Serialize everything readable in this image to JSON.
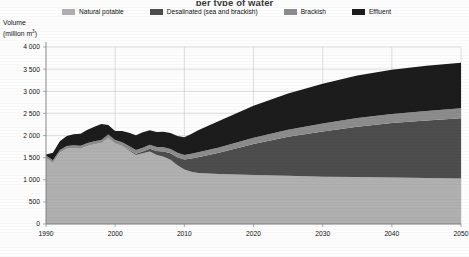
{
  "title": "per type of water",
  "axis_title_line1": "Volume",
  "axis_title_line2_pre": "(million m",
  "axis_title_line2_sup": "3",
  "axis_title_line2_post": ")",
  "legend": {
    "items": [
      {
        "label": "Natural potable",
        "color": "#b0b0b0",
        "name": "natural-potable"
      },
      {
        "label": "Desalinated (sea and brackish)",
        "color": "#4d4d4d",
        "name": "desalinated"
      },
      {
        "label": "Brackish",
        "color": "#8c8c8c",
        "name": "brackish"
      },
      {
        "label": "Effluent",
        "color": "#1c1c1c",
        "name": "effluent"
      }
    ]
  },
  "chart_data": {
    "type": "area",
    "stacked": true,
    "title": "per type of water",
    "xlabel": "",
    "ylabel": "Volume (million m3)",
    "xlim": [
      1990,
      2050
    ],
    "ylim": [
      0,
      4000
    ],
    "ytick_step": 500,
    "xtick_step": 10,
    "grid": true,
    "legend_position": "top",
    "ytick_labels": [
      "0",
      "500",
      "1 000",
      "1 500",
      "2 000",
      "2 500",
      "3 000",
      "3 500",
      "4 000"
    ],
    "ytick_values": [
      0,
      500,
      1000,
      1500,
      2000,
      2500,
      3000,
      3500,
      4000
    ],
    "xtick_labels": [
      "1990",
      "2000",
      "2010",
      "2020",
      "2030",
      "2040",
      "2050"
    ],
    "xtick_values": [
      1990,
      2000,
      2010,
      2020,
      2030,
      2040,
      2050
    ],
    "x": [
      1990,
      1991,
      1992,
      1993,
      1994,
      1995,
      1996,
      1997,
      1998,
      1999,
      2000,
      2001,
      2002,
      2003,
      2004,
      2005,
      2006,
      2007,
      2008,
      2009,
      2010,
      2011,
      2012,
      2015,
      2020,
      2025,
      2030,
      2035,
      2040,
      2045,
      2050
    ],
    "series": [
      {
        "name": "Natural potable",
        "color": "#b0b0b0",
        "values": [
          1490,
          1380,
          1610,
          1700,
          1720,
          1700,
          1760,
          1800,
          1830,
          1940,
          1820,
          1760,
          1660,
          1560,
          1600,
          1640,
          1560,
          1520,
          1450,
          1330,
          1230,
          1180,
          1150,
          1130,
          1110,
          1090,
          1070,
          1060,
          1050,
          1040,
          1030
        ]
      },
      {
        "name": "Desalinated (sea and brackish)",
        "color": "#4d4d4d",
        "values": [
          0,
          0,
          0,
          0,
          0,
          0,
          0,
          0,
          0,
          0,
          0,
          10,
          20,
          30,
          40,
          60,
          90,
          120,
          150,
          180,
          230,
          300,
          360,
          480,
          700,
          880,
          1020,
          1140,
          1230,
          1300,
          1360
        ]
      },
      {
        "name": "Brackish",
        "color": "#8c8c8c",
        "values": [
          60,
          60,
          60,
          60,
          60,
          70,
          70,
          70,
          70,
          80,
          80,
          80,
          80,
          85,
          85,
          90,
          90,
          95,
          95,
          100,
          100,
          105,
          110,
          120,
          140,
          160,
          180,
          195,
          205,
          215,
          225
        ]
      },
      {
        "name": "Effluent",
        "color": "#1c1c1c",
        "values": [
          20,
          170,
          200,
          230,
          250,
          270,
          300,
          330,
          360,
          220,
          200,
          250,
          300,
          330,
          350,
          330,
          340,
          350,
          360,
          380,
          400,
          450,
          500,
          600,
          720,
          820,
          900,
          960,
          1000,
          1020,
          1030
        ]
      }
    ],
    "totals_note": ""
  }
}
